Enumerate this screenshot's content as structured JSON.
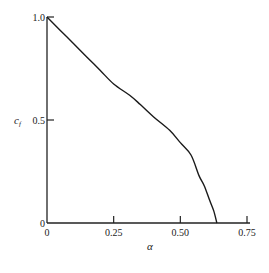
{
  "chart_data": {
    "type": "line",
    "title": "",
    "xlabel": "α",
    "ylabel": "c_f",
    "ylabel_main": "c",
    "ylabel_sub": "f",
    "xlim": [
      0,
      0.75
    ],
    "ylim": [
      0,
      1.0
    ],
    "grid": false,
    "legend": null,
    "x_ticks": [
      0,
      0.25,
      0.5,
      0.75
    ],
    "x_tick_labels": [
      "0",
      "0.25",
      "0.50",
      "0.75"
    ],
    "y_ticks": [
      0,
      0.5,
      1.0
    ],
    "y_tick_labels": [
      "0",
      "0.5",
      "1.0"
    ],
    "series": [
      {
        "name": "c_f vs α",
        "color": "#1a1a1a",
        "x": [
          0.0,
          0.05,
          0.1,
          0.15,
          0.2,
          0.25,
          0.31,
          0.35,
          0.4,
          0.46,
          0.5,
          0.54,
          0.57,
          0.59,
          0.61,
          0.625,
          0.637
        ],
        "y": [
          1.0,
          0.935,
          0.87,
          0.805,
          0.74,
          0.675,
          0.62,
          0.575,
          0.515,
          0.45,
          0.39,
          0.33,
          0.23,
          0.18,
          0.11,
          0.06,
          0.0
        ]
      }
    ]
  }
}
